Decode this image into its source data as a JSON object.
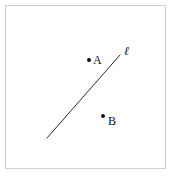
{
  "figure": {
    "kind": "geometry-diagram",
    "width": 176,
    "height": 177,
    "background_color": "#ffffff",
    "frame": {
      "border_color": "#cfcfcf",
      "border_width": 1,
      "x": 5,
      "y": 5,
      "width": 161,
      "height": 164
    },
    "line": {
      "name": "line-l",
      "label": "ℓ",
      "color": "#2b2b2b",
      "stroke_width": 1,
      "x1": 47,
      "y1": 138,
      "x2": 120,
      "y2": 55,
      "label_x": 124,
      "label_y": 51
    },
    "points": [
      {
        "name": "point-a",
        "label": "A",
        "color": "#111111",
        "radius": 2,
        "cx": 89,
        "cy": 60,
        "label_x": 93,
        "label_y": 60
      },
      {
        "name": "point-b",
        "label": "B",
        "color": "#111111",
        "radius": 2,
        "cx": 103,
        "cy": 116,
        "label_x": 108,
        "label_y": 121
      }
    ]
  }
}
